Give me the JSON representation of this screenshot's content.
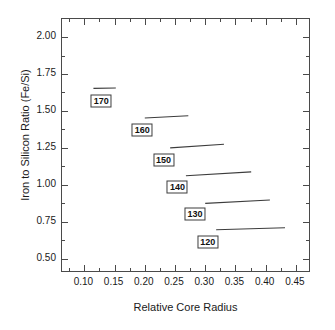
{
  "chart_data": {
    "type": "line",
    "title": "",
    "xlabel": "Relative Core Radius",
    "ylabel": "Iron to Silicon Ratio (Fe/Si)",
    "xlim": [
      0.063,
      0.475
    ],
    "ylim": [
      0.404,
      2.122
    ],
    "xticks": [
      0.1,
      0.15,
      0.2,
      0.25,
      0.3,
      0.35,
      0.4,
      0.45
    ],
    "xticklabels": [
      "0.10",
      "0.15",
      "0.20",
      "0.25",
      "0.30",
      "0.35",
      "0.40",
      "0.45"
    ],
    "yticks": [
      0.5,
      0.75,
      1.0,
      1.25,
      1.5,
      1.75,
      2.0
    ],
    "yticklabels": [
      "0.50",
      "0.75",
      "1.00",
      "1.25",
      "1.50",
      "1.75",
      "2.00"
    ],
    "xminorticks": [
      0.075,
      0.125,
      0.175,
      0.225,
      0.275,
      0.325,
      0.375,
      0.425
    ],
    "yminorticks": [
      0.625,
      0.875,
      1.125,
      1.375,
      1.625,
      1.875,
      2.125
    ],
    "grid": false,
    "legend": "inline-boxed-labels",
    "line_color": "#3c3c3c",
    "series": [
      {
        "name": "170",
        "label": "170",
        "x": [
          0.115,
          0.152
        ],
        "y": [
          1.653,
          1.655
        ],
        "label_x": 0.128,
        "label_y": 1.568
      },
      {
        "name": "160",
        "label": "160",
        "x": [
          0.2,
          0.272
        ],
        "y": [
          1.452,
          1.468
        ],
        "label_x": 0.196,
        "label_y": 1.368
      },
      {
        "name": "150",
        "label": "150",
        "x": [
          0.242,
          0.331
        ],
        "y": [
          1.25,
          1.275
        ],
        "label_x": 0.231,
        "label_y": 1.17
      },
      {
        "name": "140",
        "label": "140",
        "x": [
          0.268,
          0.376
        ],
        "y": [
          1.062,
          1.088
        ],
        "label_x": 0.254,
        "label_y": 0.988
      },
      {
        "name": "130",
        "label": "130",
        "x": [
          0.3,
          0.407
        ],
        "y": [
          0.875,
          0.898
        ],
        "label_x": 0.283,
        "label_y": 0.805
      },
      {
        "name": "120",
        "label": "120",
        "x": [
          0.318,
          0.432
        ],
        "y": [
          0.697,
          0.71
        ],
        "label_x": 0.304,
        "label_y": 0.617
      }
    ]
  }
}
